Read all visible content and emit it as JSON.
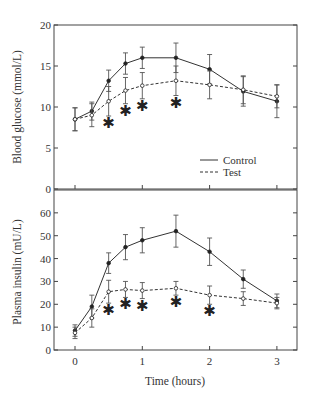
{
  "chart_data": [
    {
      "type": "line",
      "title": "",
      "xlabel": "",
      "ylabel": "Blood glucose (mmol/L)",
      "ylim": [
        0,
        20
      ],
      "yticks": [
        0,
        5,
        10,
        15,
        20
      ],
      "xlim": [
        -0.3,
        3.3
      ],
      "xticks": [
        0,
        1,
        2,
        3
      ],
      "x": [
        0,
        0.25,
        0.5,
        0.75,
        1,
        1.5,
        2,
        2.5,
        3
      ],
      "series": [
        {
          "name": "Control",
          "style": "solid",
          "marker": "filled-circle",
          "values": [
            8.5,
            9.5,
            13.2,
            15.3,
            16.0,
            16.0,
            14.6,
            11.9,
            10.7
          ],
          "error": [
            1.4,
            1.1,
            1.3,
            1.3,
            1.3,
            1.8,
            1.8,
            1.8,
            2.0
          ]
        },
        {
          "name": "Test",
          "style": "dashed",
          "marker": "open-circle",
          "values": [
            8.5,
            9.0,
            10.7,
            12.0,
            12.6,
            13.2,
            12.7,
            12.1,
            11.3
          ],
          "error": [
            1.4,
            1.4,
            1.8,
            1.6,
            1.6,
            1.8,
            1.7,
            1.7,
            1.4
          ]
        }
      ],
      "significance_markers": [
        0.5,
        0.75,
        1,
        1.5
      ],
      "legend": {
        "position": "lower right",
        "entries": [
          "Control",
          "Test"
        ]
      },
      "grid": false
    },
    {
      "type": "line",
      "title": "",
      "xlabel": "Time (hours)",
      "ylabel": "Plasma insulin (mU/L)",
      "ylim": [
        0,
        70
      ],
      "yticks": [
        0,
        10,
        20,
        30,
        40,
        50,
        60
      ],
      "xlim": [
        -0.3,
        3.3
      ],
      "xticks": [
        0,
        1,
        2,
        3
      ],
      "x": [
        0,
        0.25,
        0.5,
        0.75,
        1,
        1.5,
        2,
        2.5,
        3
      ],
      "series": [
        {
          "name": "Control",
          "style": "solid",
          "marker": "filled-circle",
          "values": [
            8.5,
            19,
            38,
            45,
            48,
            52,
            43,
            31,
            21.5
          ],
          "error": [
            2.5,
            5,
            4.5,
            5.5,
            5.5,
            7,
            6,
            4,
            3
          ]
        },
        {
          "name": "Test",
          "style": "dashed",
          "marker": "open-circle",
          "values": [
            7.5,
            14,
            25.5,
            26.5,
            26,
            27,
            24,
            22.5,
            20.5
          ],
          "error": [
            2.5,
            4,
            5,
            3.5,
            3.5,
            3,
            4,
            3,
            2.5
          ]
        }
      ],
      "significance_markers": [
        0.5,
        0.75,
        1,
        1.5,
        2
      ],
      "grid": false
    }
  ],
  "top_panel": {
    "ylabel": "Blood glucose (mmol/L)",
    "yticks": [
      "0",
      "5",
      "10",
      "15",
      "20"
    ],
    "legend": {
      "control": "Control",
      "test": "Test"
    }
  },
  "bottom_panel": {
    "ylabel": "Plasma insulin (mU/L)",
    "yticks": [
      "0",
      "10",
      "20",
      "30",
      "40",
      "50",
      "60"
    ],
    "xticks": [
      "0",
      "1",
      "2",
      "3"
    ],
    "xlabel": "Time (hours)"
  },
  "significance_symbol": "✱"
}
